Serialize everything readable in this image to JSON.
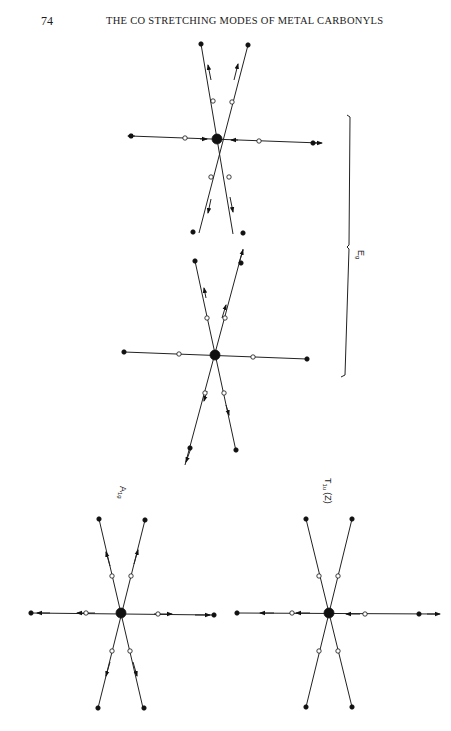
{
  "page": {
    "number": "74",
    "running_head": "THE CO STRETCHING MODES OF METAL CARBONYLS"
  },
  "figure": {
    "diagrams": [
      {
        "id": "eg-a",
        "mode": "E_g",
        "label": "",
        "center": [
          217,
          139
        ]
      },
      {
        "id": "eg-b",
        "mode": "E_g",
        "label": "",
        "center": [
          215,
          355
        ]
      },
      {
        "id": "a1g",
        "mode": "A_1g",
        "label": "A",
        "label_sub": "1g",
        "center": [
          121,
          613
        ]
      },
      {
        "id": "t1u",
        "mode": "T_1u(Z)",
        "label": "T",
        "label_sub": "1u",
        "label_suffix": "(Z)",
        "center": [
          329,
          613
        ]
      }
    ],
    "brace_label": "E",
    "brace_label_sub": "g",
    "legend": {
      "large_filled_circle": "metal atom",
      "open_circle": "carbon atom",
      "small_filled_circle": "oxygen atom",
      "arrow": "displacement"
    }
  }
}
